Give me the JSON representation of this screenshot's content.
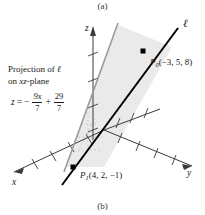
{
  "figure": {
    "caption_top": "(a)",
    "caption_bottom": "(b)",
    "type": "3d-coordinate-diagram"
  },
  "axes": {
    "z_label": "z",
    "y_label": "y",
    "x_label": "x"
  },
  "line": {
    "label": "ℓ",
    "color": "#000000"
  },
  "projection": {
    "text_line1_prefix": "Projection of ",
    "text_line1_symbol": "ℓ",
    "text_line2_italic": "xz",
    "text_line2_suffix": "-plane",
    "color": "#9a9a9a"
  },
  "equation": {
    "lhs": "z",
    "eq": "=",
    "minus": "−",
    "term1_num": "9x",
    "term1_den": "7",
    "plus": "+",
    "term2_num": "29",
    "term2_den": "7"
  },
  "points": [
    {
      "name": "P",
      "sub": "0",
      "coords": "(−3, 5, 8)",
      "x": -3,
      "y": 5,
      "z": 8
    },
    {
      "name": "P",
      "sub": "1",
      "coords": "(4, 2, −1)",
      "x": 4,
      "y": 2,
      "z": -1
    }
  ],
  "colors": {
    "line": "#000000",
    "projection_line": "#9a9a9a",
    "shade": "#e9e9e9",
    "axis": "#3a3a3a",
    "background": "#ffffff"
  }
}
